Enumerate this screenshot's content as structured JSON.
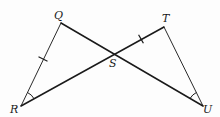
{
  "figure": {
    "type": "geometry",
    "points": {
      "Q": {
        "label": "Q",
        "x": 61,
        "y": 23
      },
      "T": {
        "label": "T",
        "x": 164,
        "y": 27
      },
      "R": {
        "label": "R",
        "x": 21,
        "y": 106
      },
      "U": {
        "label": "U",
        "x": 203,
        "y": 106
      },
      "S": {
        "label": "S",
        "x": 113,
        "y": 54
      }
    },
    "segments": [
      {
        "name": "QR",
        "from": "Q",
        "to": "R",
        "weight": "thin"
      },
      {
        "name": "TU",
        "from": "T",
        "to": "U",
        "weight": "thin"
      },
      {
        "name": "QU",
        "from": "Q",
        "to": "U",
        "weight": "thick"
      },
      {
        "name": "RT",
        "from": "R",
        "to": "T",
        "weight": "thick"
      }
    ],
    "congruence_marks": {
      "ticks": [
        {
          "segment": "QR",
          "count": 1
        },
        {
          "segment": "ST",
          "count": 1
        }
      ],
      "angle_arcs": [
        {
          "vertex": "R",
          "count": 1
        },
        {
          "vertex": "U",
          "count": 1
        }
      ]
    },
    "labels": {
      "Q": "Q",
      "T": "T",
      "R": "R",
      "U": "U",
      "S": "S"
    }
  }
}
